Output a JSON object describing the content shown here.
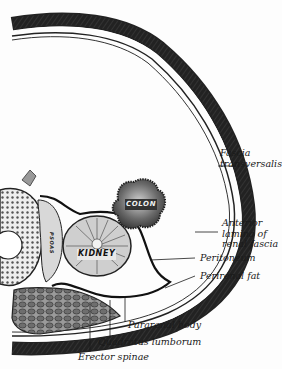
{
  "figure": {
    "type": "anatomical cross-section",
    "organs": {
      "colon": "COLON",
      "kidney": "KIDNEY",
      "psoas": "PSOAS"
    },
    "labels": [
      {
        "id": "fascia-transversalis",
        "line1": "Fascia",
        "line2": "transversalis"
      },
      {
        "id": "anterior-lamina",
        "line1": "Anterior",
        "line2": "lamina of",
        "line3": "renal fascia"
      },
      {
        "id": "peritoneum",
        "line1": "Peritoneum"
      },
      {
        "id": "perirenal-fat",
        "line1": "Perirenal fat"
      },
      {
        "id": "pararenal-body",
        "line1": "Pararenal body"
      },
      {
        "id": "quadratus-lumborum",
        "line1": "Quadratus lumborum"
      },
      {
        "id": "erector-spinae",
        "line1": "Erector spinae"
      }
    ],
    "colors": {
      "ink": "#1a1a1a",
      "paper": "#fdfdfd",
      "colon_fill": "#5a5a5a",
      "kidney_fill": "#cfcfcf"
    }
  }
}
